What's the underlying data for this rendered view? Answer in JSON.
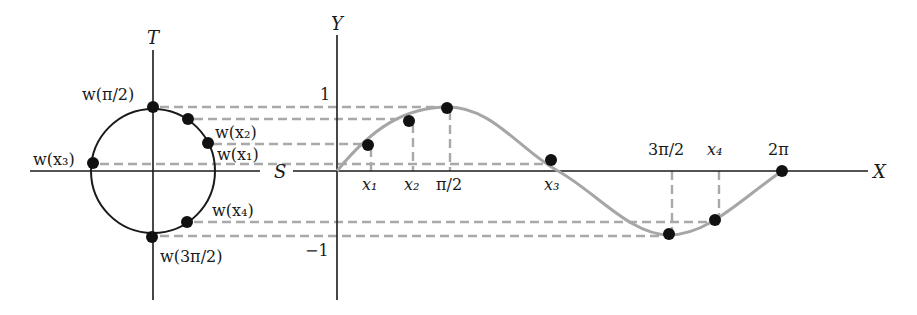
{
  "figure": {
    "circle_plot": {
      "axis_labels": {
        "horizontal": "S",
        "vertical": "T"
      },
      "points": [
        {
          "id": "pi_over_2",
          "label": "w(π/2)",
          "cx": 153,
          "cy": 107
        },
        {
          "id": "x2",
          "label": "w(x₂)",
          "cx": 188,
          "cy": 119
        },
        {
          "id": "x1",
          "label": "w(x₁)",
          "cx": 208,
          "cy": 143
        },
        {
          "id": "x3",
          "label": "w(x₃)",
          "cx": 93,
          "cy": 163
        },
        {
          "id": "x4",
          "label": "w(x₄)",
          "cx": 187,
          "cy": 222
        },
        {
          "id": "three_pi_over_2",
          "label": "w(3π/2)",
          "cx": 152,
          "cy": 237
        }
      ]
    },
    "sine_plot": {
      "axis_labels": {
        "horizontal": "X",
        "vertical": "Y"
      },
      "y_ticks": [
        {
          "label": "1"
        },
        {
          "label": "−1"
        }
      ],
      "x_ticks_below": [
        {
          "label": "x₁"
        },
        {
          "label": "x₂"
        },
        {
          "label": "π/2"
        },
        {
          "label": "x₃"
        }
      ],
      "x_ticks_above": [
        {
          "label": "3π/2"
        },
        {
          "label": "x₄"
        },
        {
          "label": "2π"
        }
      ],
      "points": [
        {
          "id": "x1",
          "cx": 368,
          "cy": 145
        },
        {
          "id": "x2",
          "cx": 409,
          "cy": 121
        },
        {
          "id": "pi_over_2",
          "cx": 447,
          "cy": 108
        },
        {
          "id": "x3",
          "cx": 551,
          "cy": 160
        },
        {
          "id": "three_pi_over_2",
          "cx": 669,
          "cy": 234
        },
        {
          "id": "x4",
          "cx": 715,
          "cy": 220
        },
        {
          "id": "two_pi",
          "cx": 782,
          "cy": 171
        }
      ]
    },
    "colors": {
      "axis": "#1a1a1a",
      "curve": "#a6a6a6",
      "dashed_guides": "#a9a9a9",
      "points": "#111111"
    }
  }
}
